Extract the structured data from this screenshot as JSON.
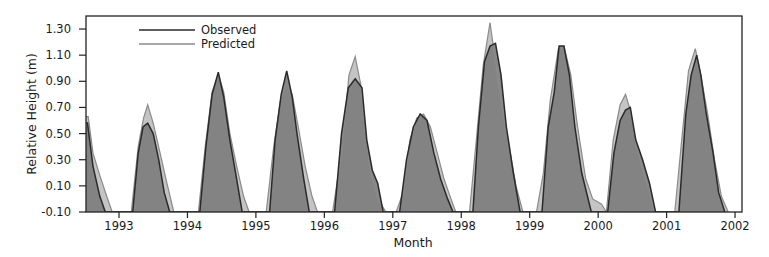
{
  "chart_data": {
    "type": "area",
    "title": "",
    "xlabel": "Month",
    "ylabel": "Relative Height (m)",
    "xlim": [
      1992.52,
      2002.1
    ],
    "ylim": [
      -0.1,
      1.4
    ],
    "yticks": [
      "1.30",
      "1.10",
      "0.90",
      "0.70",
      "0.50",
      "0.30",
      "0.10",
      "-0.10"
    ],
    "ytick_values": [
      1.3,
      1.1,
      0.9,
      0.7,
      0.5,
      0.3,
      0.1,
      -0.1
    ],
    "xticks": [
      "1993",
      "1994",
      "1995",
      "1996",
      "1997",
      "1998",
      "1999",
      "2000",
      "2001",
      "2002"
    ],
    "xtick_values": [
      1993,
      1994,
      1995,
      1996,
      1997,
      1998,
      1999,
      2000,
      2001,
      2002
    ],
    "grid": false,
    "legend": {
      "position": "upper-left",
      "entries": [
        "Observed",
        "Predicted"
      ]
    },
    "colors": {
      "observed_line": "#2a2a2a",
      "observed_fill": "#7d7d7d",
      "predicted_line": "#8a8a8a",
      "predicted_fill": "#c4c4c4",
      "axis": "#222222"
    },
    "series": [
      {
        "name": "Observed",
        "x": [
          1992.52,
          1992.54,
          1992.62,
          1992.72,
          1992.8,
          1993.2,
          1993.28,
          1993.35,
          1993.42,
          1993.5,
          1993.58,
          1993.66,
          1993.74,
          1994.18,
          1994.27,
          1994.36,
          1994.45,
          1994.53,
          1994.62,
          1994.72,
          1994.8,
          1995.2,
          1995.28,
          1995.37,
          1995.45,
          1995.53,
          1995.6,
          1995.7,
          1995.78,
          1996.15,
          1996.25,
          1996.35,
          1996.45,
          1996.55,
          1996.62,
          1996.7,
          1996.78,
          1996.86,
          1997.1,
          1997.2,
          1997.3,
          1997.4,
          1997.5,
          1997.6,
          1997.7,
          1997.8,
          1997.88,
          1998.17,
          1998.25,
          1998.34,
          1998.42,
          1998.5,
          1998.58,
          1998.66,
          1998.76,
          1998.86,
          1999.18,
          1999.27,
          1999.36,
          1999.43,
          1999.5,
          1999.58,
          1999.66,
          1999.76,
          1999.9,
          2000.14,
          2000.23,
          2000.32,
          2000.4,
          2000.47,
          2000.55,
          2000.65,
          2000.75,
          2000.84,
          2001.18,
          2001.28,
          2001.36,
          2001.44,
          2001.5,
          2001.58,
          2001.68,
          2001.76,
          2001.85
        ],
        "y": [
          0.58,
          0.58,
          0.25,
          0.02,
          -0.1,
          -0.1,
          0.35,
          0.55,
          0.58,
          0.5,
          0.3,
          0.05,
          -0.1,
          -0.1,
          0.4,
          0.8,
          0.97,
          0.78,
          0.45,
          0.15,
          -0.1,
          -0.1,
          0.45,
          0.8,
          0.98,
          0.78,
          0.5,
          0.15,
          -0.1,
          -0.1,
          0.5,
          0.85,
          0.92,
          0.85,
          0.45,
          0.22,
          0.12,
          -0.1,
          -0.1,
          0.3,
          0.55,
          0.65,
          0.6,
          0.35,
          0.15,
          0.0,
          -0.1,
          -0.1,
          0.55,
          1.05,
          1.17,
          1.19,
          0.95,
          0.55,
          0.2,
          -0.1,
          -0.1,
          0.55,
          0.82,
          1.17,
          1.17,
          0.95,
          0.55,
          0.2,
          -0.1,
          -0.1,
          0.35,
          0.6,
          0.68,
          0.7,
          0.45,
          0.3,
          0.12,
          -0.1,
          -0.1,
          0.65,
          0.95,
          1.1,
          0.95,
          0.65,
          0.35,
          0.05,
          -0.1
        ]
      },
      {
        "name": "Predicted",
        "x": [
          1992.52,
          1992.55,
          1992.62,
          1992.72,
          1992.82,
          1992.9,
          1993.18,
          1993.28,
          1993.36,
          1993.42,
          1993.5,
          1993.6,
          1993.7,
          1993.8,
          1994.16,
          1994.26,
          1994.36,
          1994.45,
          1994.53,
          1994.62,
          1994.72,
          1994.82,
          1994.9,
          1995.15,
          1995.26,
          1995.36,
          1995.45,
          1995.53,
          1995.62,
          1995.72,
          1995.82,
          1995.9,
          1996.12,
          1996.25,
          1996.36,
          1996.45,
          1996.53,
          1996.6,
          1996.68,
          1996.78,
          1996.9,
          1997.05,
          1997.15,
          1997.25,
          1997.35,
          1997.45,
          1997.55,
          1997.65,
          1997.75,
          1997.85,
          1997.92,
          1998.12,
          1998.22,
          1998.32,
          1998.42,
          1998.5,
          1998.6,
          1998.7,
          1998.8,
          1998.9,
          1999.1,
          1999.2,
          1999.3,
          1999.42,
          1999.5,
          1999.6,
          1999.7,
          1999.82,
          1999.92,
          2000.05,
          2000.12,
          2000.22,
          2000.32,
          2000.4,
          2000.47,
          2000.55,
          2000.65,
          2000.75,
          2000.82,
          2001.12,
          2001.22,
          2001.32,
          2001.42,
          2001.5,
          2001.6,
          2001.7,
          2001.8,
          2001.9
        ],
        "y": [
          0.63,
          0.63,
          0.35,
          0.18,
          0.02,
          -0.1,
          -0.1,
          0.4,
          0.62,
          0.72,
          0.58,
          0.35,
          0.12,
          -0.1,
          -0.1,
          0.4,
          0.82,
          0.95,
          0.82,
          0.5,
          0.25,
          0.02,
          -0.1,
          -0.1,
          0.4,
          0.75,
          0.88,
          0.8,
          0.55,
          0.25,
          0.02,
          -0.1,
          -0.1,
          0.35,
          0.95,
          1.09,
          0.88,
          0.5,
          0.2,
          0.0,
          -0.1,
          -0.1,
          0.05,
          0.45,
          0.62,
          0.65,
          0.55,
          0.35,
          0.15,
          0.0,
          -0.1,
          -0.1,
          0.45,
          1.02,
          1.35,
          1.05,
          0.68,
          0.4,
          0.1,
          -0.1,
          -0.1,
          0.2,
          0.75,
          1.15,
          1.17,
          0.95,
          0.55,
          0.15,
          0.0,
          -0.04,
          -0.1,
          0.45,
          0.72,
          0.8,
          0.68,
          0.42,
          0.22,
          0.05,
          -0.1,
          -0.1,
          0.45,
          0.98,
          1.15,
          0.95,
          0.65,
          0.3,
          0.02,
          -0.1
        ]
      }
    ]
  }
}
